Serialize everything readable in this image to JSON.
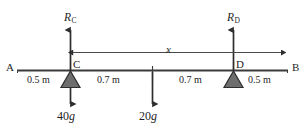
{
  "diagram": {
    "beam": {
      "left_end_label": "A",
      "right_end_label": "B"
    },
    "supports": [
      {
        "id": "support-c",
        "label": "C",
        "reaction_label": "R",
        "reaction_subscript": "C"
      },
      {
        "id": "support-d",
        "label": "D",
        "reaction_label": "R",
        "reaction_subscript": "D"
      }
    ],
    "dimensions": [
      {
        "id": "dim-a-c",
        "text": "0.5 m"
      },
      {
        "id": "dim-c-mid",
        "text": "0.7 m"
      },
      {
        "id": "dim-mid-d",
        "text": "0.7 m"
      },
      {
        "id": "dim-d-b",
        "text": "0.5 m"
      }
    ],
    "span_dimension": {
      "id": "dim-x",
      "label": "x"
    },
    "loads": [
      {
        "id": "load-40g",
        "value": "40",
        "symbol": "g"
      },
      {
        "id": "load-20g",
        "value": "20",
        "symbol": "g"
      }
    ],
    "colors": {
      "line": "#3a3a3a",
      "support_fill": "#6e6e6e",
      "support_stroke": "#2e2e2e",
      "text": "#1f1f1f",
      "background": "#ffffff"
    }
  }
}
